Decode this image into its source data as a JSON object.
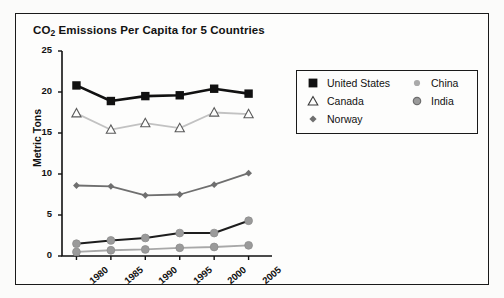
{
  "page": {
    "background_color": "#fbfbfa",
    "frame_border_color": "#1a1a1a"
  },
  "chart_data": {
    "type": "line",
    "title": "CO2 Emissions Per Capita for 5 Countries",
    "title_main": "CO",
    "title_sub": "2",
    "title_rest": " Emissions Per Capita for 5 Countries",
    "xlabel": "",
    "ylabel": "Metric Tons",
    "categories": [
      "1980",
      "1985",
      "1990",
      "1995",
      "2000",
      "2005"
    ],
    "x": [
      1980,
      1985,
      1990,
      1995,
      2000,
      2005
    ],
    "ylim": [
      0,
      25
    ],
    "yticks": [
      "0",
      "5",
      "10",
      "15",
      "20",
      "25"
    ],
    "ytick_values": [
      0,
      5,
      10,
      15,
      20,
      25
    ],
    "grid": false,
    "legend_position": "upper right outside",
    "series": [
      {
        "name": "United States",
        "values": [
          20.8,
          18.9,
          19.5,
          19.6,
          20.4,
          19.8
        ],
        "color": "#111111",
        "marker": "filled-square",
        "line_width": 2.6
      },
      {
        "name": "Canada",
        "values": [
          17.4,
          15.4,
          16.2,
          15.6,
          17.5,
          17.3
        ],
        "color": "#c2c2c2",
        "marker": "open-triangle",
        "marker_edge_color": "#5a5a5a",
        "line_width": 1.8
      },
      {
        "name": "Norway",
        "values": [
          8.6,
          8.5,
          7.4,
          7.5,
          8.7,
          10.1
        ],
        "color": "#6f6f6f",
        "marker": "diamond",
        "line_width": 1.8
      },
      {
        "name": "China",
        "values": [
          1.5,
          1.9,
          2.2,
          2.8,
          2.8,
          4.3
        ],
        "color": "#1d1d1d",
        "marker": "circle",
        "marker_face_color": "#9a9a9a",
        "line_width": 2.0
      },
      {
        "name": "India",
        "values": [
          0.5,
          0.7,
          0.8,
          1.0,
          1.1,
          1.3
        ],
        "color": "#a8a8a8",
        "marker": "circle",
        "marker_face_color": "#9a9a9a",
        "line_width": 1.8
      }
    ]
  },
  "legend": {
    "entries": [
      {
        "label": "United States",
        "marker": "filled-square"
      },
      {
        "label": "Canada",
        "marker": "open-triangle"
      },
      {
        "label": "Norway",
        "marker": "diamond"
      },
      {
        "label": "China",
        "marker": "small-circle"
      },
      {
        "label": "India",
        "marker": "ring-circle"
      }
    ]
  }
}
